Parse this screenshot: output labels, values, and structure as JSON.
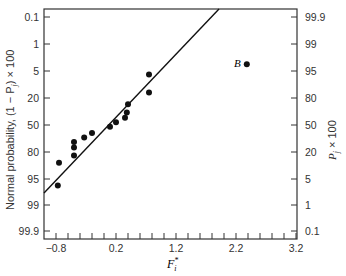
{
  "chart_data": {
    "type": "scatter",
    "title": "",
    "xlabel": "F_i*",
    "ylabel_left": "Normal probability, (1 − P_j) × 100",
    "ylabel_right": "P_j × 100",
    "xlim": [
      -1.0,
      3.22
    ],
    "x_ticks": [
      "-0.8",
      "0.2",
      "1.2",
      "2.2",
      "3.2"
    ],
    "y_left_ticks": [
      "0.1",
      "1",
      "5",
      "20",
      "50",
      "80",
      "95",
      "99",
      "99.9"
    ],
    "y_right_ticks": [
      "99.9",
      "99",
      "95",
      "80",
      "50",
      "20",
      "5",
      "1",
      "0.1"
    ],
    "grid": false,
    "series": [
      {
        "name": "observations",
        "points": [
          {
            "x": -0.77,
            "y": 96
          },
          {
            "x": -0.75,
            "y": 86
          },
          {
            "x": -0.5,
            "y": 82
          },
          {
            "x": -0.5,
            "y": 75
          },
          {
            "x": -0.5,
            "y": 69
          },
          {
            "x": -0.33,
            "y": 64
          },
          {
            "x": -0.2,
            "y": 59
          },
          {
            "x": 0.1,
            "y": 52
          },
          {
            "x": 0.2,
            "y": 47
          },
          {
            "x": 0.35,
            "y": 42
          },
          {
            "x": 0.38,
            "y": 36
          },
          {
            "x": 0.4,
            "y": 27
          },
          {
            "x": 0.75,
            "y": 17
          },
          {
            "x": 0.75,
            "y": 7
          },
          {
            "x": 2.38,
            "y": 4,
            "label": "B"
          }
        ]
      }
    ],
    "fit_line": {
      "from": {
        "x": -1.0,
        "y": 98
      },
      "to": {
        "x": 1.92,
        "y": 0.08
      }
    },
    "annotations": [
      {
        "text": "B",
        "x": 2.38,
        "y": 4
      }
    ]
  },
  "axes": {
    "x_label_main": "F",
    "x_label_sup": "*",
    "x_label_sub": "i",
    "left_label": "Normal probability, (1 − P",
    "left_label_sub": "j",
    "left_label_tail": ") × 100",
    "right_label": "P",
    "right_label_sub": "j",
    "right_label_tail": " × 100",
    "point_label": "B"
  }
}
